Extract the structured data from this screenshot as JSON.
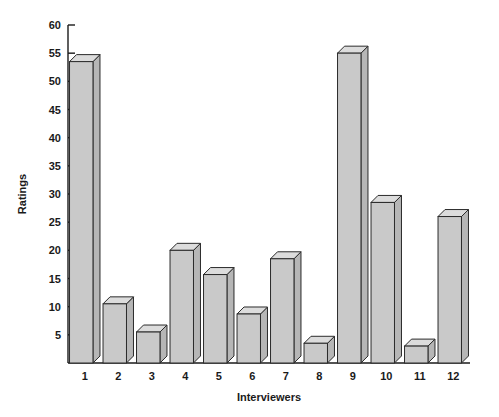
{
  "chart_data": {
    "type": "bar",
    "title": "",
    "subtitle": "",
    "xlabel": "Interviewers",
    "ylabel": "Ratings",
    "categories": [
      "1",
      "2",
      "3",
      "4",
      "5",
      "6",
      "7",
      "8",
      "9",
      "10",
      "11",
      "12"
    ],
    "values": [
      53.5,
      10.5,
      5.5,
      20,
      15.7,
      8.7,
      18.5,
      3.5,
      55,
      28.5,
      3,
      26
    ],
    "series": [
      {
        "name": "Ratings",
        "values": [
          53.5,
          10.5,
          5.5,
          20,
          15.7,
          8.7,
          18.5,
          3.5,
          55,
          28.5,
          3,
          26
        ]
      }
    ],
    "ylim": [
      0,
      60
    ],
    "ytick_values": [
      5,
      10,
      15,
      20,
      25,
      30,
      35,
      40,
      45,
      50,
      55,
      60
    ],
    "ytick_labels": [
      "5",
      "10",
      "15",
      "20",
      "25",
      "30",
      "35",
      "40",
      "45",
      "50",
      "55",
      "60"
    ],
    "grid": false,
    "legend": false,
    "legend_position": "none",
    "style": "3d-bar",
    "bar_face_color": "#c9c9c9",
    "bar_top_color": "#dcdcdc",
    "bar_side_color": "#b6b6b6",
    "bar_edge_color": "#2b2b2b",
    "background_color": "#ffffff",
    "axis_color": "#1a1a1a",
    "spines": [
      "left",
      "bottom"
    ],
    "tick_direction": "in"
  }
}
